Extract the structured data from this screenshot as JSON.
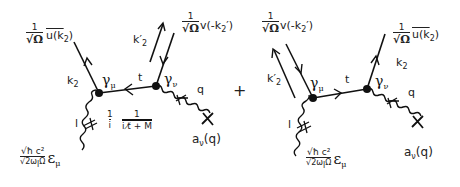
{
  "diagram": {
    "type": "feynman-diagram",
    "operator": "+",
    "left": {
      "outgoing_electron": {
        "prefactor_num": "1",
        "prefactor_den": "√Ω",
        "spinor": "u̅(k₂)",
        "spinor_text": "u(k",
        "spinor_sub": "2",
        "spinor_close": ")",
        "momentum_label": "k",
        "momentum_sub": "2"
      },
      "outgoing_positron": {
        "prefactor_num": "1",
        "prefactor_den": "√Ω",
        "spinor_text": "v(-k",
        "spinor_sub": "2",
        "spinor_close": "′)",
        "momentum_label": "k",
        "momentum_sub": "2",
        "momentum_prime": "′"
      },
      "vertex1": {
        "label": "γ",
        "sub": "μ"
      },
      "vertex2": {
        "label": "γ",
        "sub": "ν"
      },
      "propagator": {
        "momentum_label": "t",
        "factor_num": "1",
        "factor_den": "i",
        "prop_num": "1",
        "prop_den": "i t̸ + M"
      },
      "incoming_photon": {
        "momentum_label": "l",
        "amp_num": "√ħ c²",
        "amp_den": "√2ω",
        "amp_den_sub": "l",
        "amp_den_tail": "Ω",
        "polarization": "ε",
        "polarization_sub": "μ"
      },
      "coulomb_field": {
        "momentum_label": "q",
        "field_label": "a",
        "field_sub": "ν",
        "field_arg": "(q)"
      }
    },
    "right": {
      "outgoing_positron": {
        "prefactor_num": "1",
        "prefactor_den": "√Ω",
        "spinor_text": "v(-k",
        "spinor_sub": "2",
        "spinor_close": "′)",
        "momentum_label": "k",
        "momentum_sub": "2",
        "momentum_prime": "′"
      },
      "outgoing_electron": {
        "prefactor_num": "1",
        "prefactor_den": "√Ω",
        "spinor_text": "u(k",
        "spinor_sub": "2",
        "spinor_close": ")",
        "momentum_label": "k",
        "momentum_sub": "2"
      },
      "vertex1": {
        "label": "γ",
        "sub": "μ"
      },
      "vertex2": {
        "label": "γ",
        "sub": "ν"
      },
      "propagator": {
        "momentum_label": "t"
      },
      "incoming_photon": {
        "momentum_label": "l",
        "amp_num": "√ħ c²",
        "amp_den": "√2ω",
        "amp_den_sub": "l",
        "amp_den_tail": "Ω",
        "polarization": "ε",
        "polarization_sub": "μ"
      },
      "coulomb_field": {
        "momentum_label": "q",
        "field_label": "a",
        "field_sub": "ν",
        "field_arg": "(q)"
      }
    }
  }
}
